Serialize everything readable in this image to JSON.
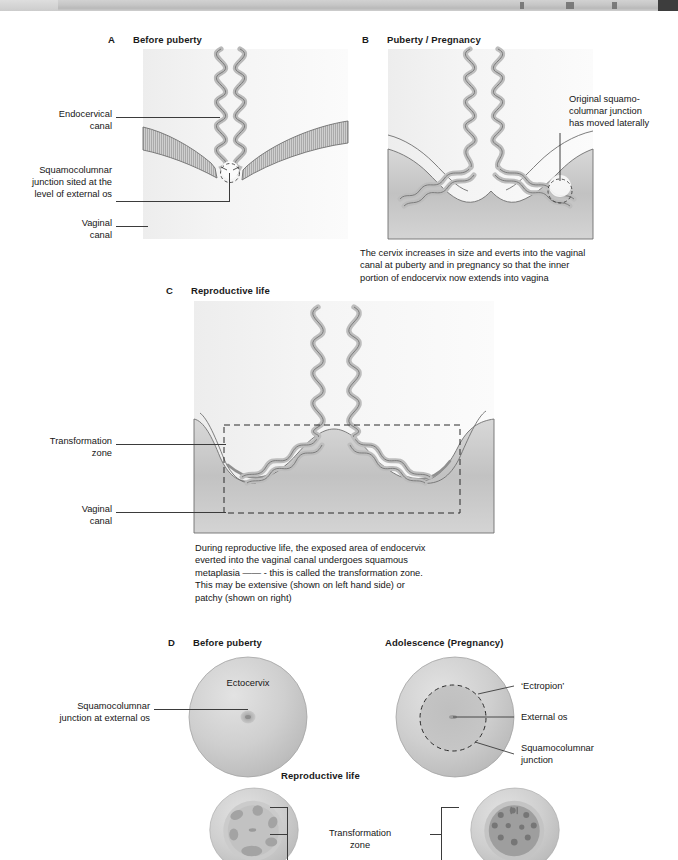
{
  "toolbar": {
    "present": true,
    "description": "partially-visible application toolbar strip"
  },
  "figure": {
    "panels": {
      "a": {
        "letter": "A",
        "title": "Before puberty",
        "labels": {
          "endocervical_canal": "Endocervical\ncanal",
          "squamocolumnar_junction": "Squamocolumnar\njunction sited at the\nlevel of external os",
          "vaginal_canal": "Vaginal\ncanal"
        }
      },
      "b": {
        "letter": "B",
        "title": "Puberty / Pregnancy",
        "labels": {
          "original_scj": "Original squamo-\ncolumnar junction\nhas moved laterally"
        },
        "caption": "The cervix increases in size and everts into the vaginal\ncanal at puberty and in pregnancy so that the inner\nportion of endocervix now extends into vagina"
      },
      "c": {
        "letter": "C",
        "title": "Reproductive life",
        "labels": {
          "transformation_zone": "Transformation\nzone",
          "vaginal_canal": "Vaginal\ncanal"
        },
        "caption": "During reproductive life, the exposed area of endocervix\neverted into the vaginal canal undergoes squamous\nmetaplasia —— - this is called the transformation zone.\nThis may be extensive (shown on left hand side) or\npatchy (shown on right)"
      },
      "d": {
        "letter": "D",
        "title": "Before puberty",
        "labels": {
          "ectocervix": "Ectocervix",
          "squamocolumnar_junction": "Squamocolumnar\njunction at external os"
        }
      },
      "e": {
        "title": "Adolescence (Pregnancy)",
        "labels": {
          "ectropion": "‘Ectropion’",
          "external_os": "External os",
          "squamocolumnar_junction": "Squamocolumnar\njunction"
        }
      },
      "f": {
        "title": "Reproductive life",
        "labels": {
          "transformation_zone": "Transformation\nzone"
        }
      }
    }
  },
  "colors": {
    "ink": "#161616",
    "leader": "#3b3b3b",
    "tissue_fill": "#c9c9c9",
    "tissue_stroke": "#6f6f6f",
    "scene_background": "#f2f2f2",
    "dashed_outline": "#2b2b2b",
    "toolbar": "#c6c6c6",
    "toolbar_dark_block": "#3d3d3d"
  }
}
